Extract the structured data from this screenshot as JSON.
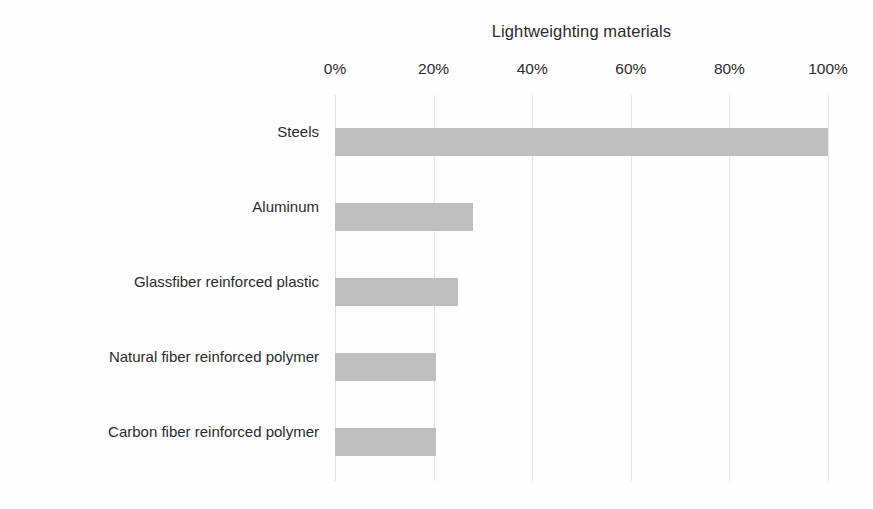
{
  "chart_data": {
    "type": "bar",
    "orientation": "horizontal",
    "title": "Lightweighting materials",
    "xlabel": "",
    "ylabel": "",
    "xlim": [
      0,
      100
    ],
    "x_tick_labels": [
      "0%",
      "20%",
      "40%",
      "60%",
      "80%",
      "100%"
    ],
    "x_tick_values": [
      0,
      20,
      40,
      60,
      80,
      100
    ],
    "grid": true,
    "grid_axis": "x",
    "legend": false,
    "axis_position": "top",
    "bar_color": "#bfbfbf",
    "background_color": "#ffffff",
    "text_color": "#2b2b2b",
    "categories": [
      "Steels",
      "Aluminum",
      "Glassfiber reinforced plastic",
      "Natural fiber reinforced polymer",
      "Carbon fiber reinforced polymer"
    ],
    "values": [
      100,
      28,
      25,
      20.5,
      20.5
    ],
    "value_unit": "%"
  }
}
